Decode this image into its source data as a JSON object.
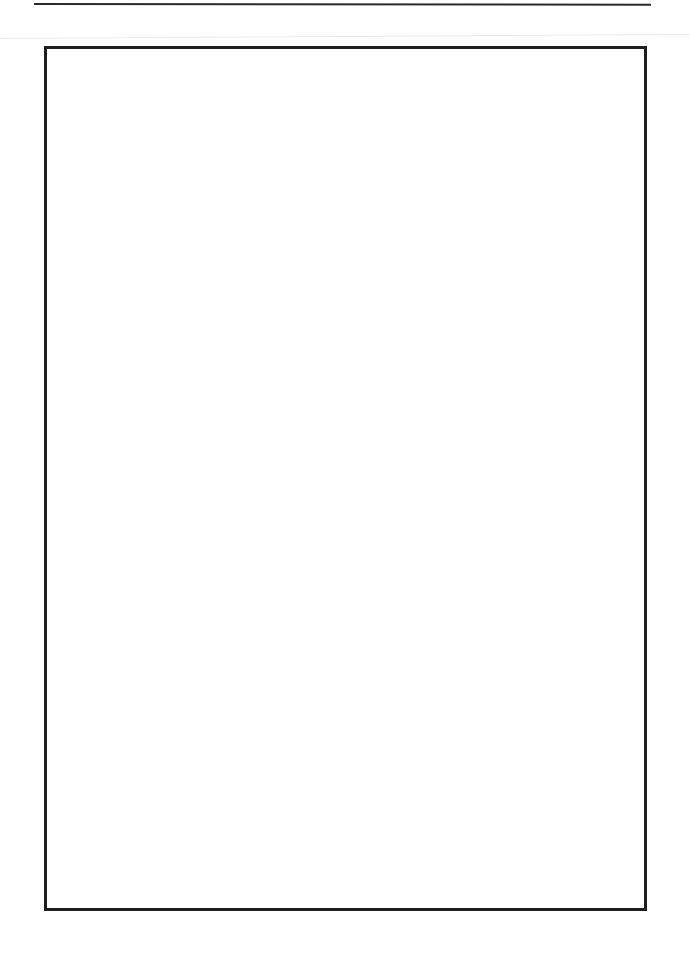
{
  "page": {
    "type": "blank-framed-page",
    "header_rule": true,
    "frame": {
      "border_color": "#1e1e1e",
      "content": ""
    }
  },
  "colors": {
    "background": "#ffffff",
    "rule": "#2a2a2a",
    "frame_border": "#1e1e1e"
  }
}
